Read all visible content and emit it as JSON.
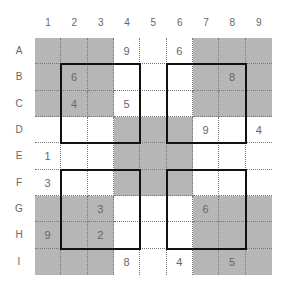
{
  "puzzle": {
    "type": "hyper-sudoku",
    "column_labels": [
      "1",
      "2",
      "3",
      "4",
      "5",
      "6",
      "7",
      "8",
      "9"
    ],
    "row_labels": [
      "A",
      "B",
      "C",
      "D",
      "E",
      "F",
      "G",
      "H",
      "I"
    ],
    "colors": {
      "shaded_box": "#b6b6b6",
      "plain_box": "#ffffff",
      "digit": "#666666",
      "window_border": "#111111"
    },
    "shaded_boxes": [
      [
        0,
        0
      ],
      [
        0,
        2
      ],
      [
        1,
        1
      ],
      [
        2,
        0
      ],
      [
        2,
        2
      ]
    ],
    "windows": [
      {
        "rows": "B-D",
        "cols": "2-4"
      },
      {
        "rows": "B-D",
        "cols": "6-8"
      },
      {
        "rows": "F-H",
        "cols": "2-4"
      },
      {
        "rows": "F-H",
        "cols": "6-8"
      }
    ],
    "grid": [
      [
        "",
        "",
        "",
        "9",
        "",
        "6",
        "",
        "",
        ""
      ],
      [
        "",
        "6",
        "",
        "",
        "",
        "",
        "",
        "8",
        ""
      ],
      [
        "",
        "4",
        "",
        "5",
        "",
        "",
        "",
        "",
        ""
      ],
      [
        "",
        "",
        "",
        "",
        "",
        "",
        "9",
        "",
        "4"
      ],
      [
        "1",
        "",
        "",
        "",
        "",
        "",
        "",
        "",
        ""
      ],
      [
        "3",
        "",
        "",
        "",
        "",
        "",
        "",
        "",
        ""
      ],
      [
        "",
        "",
        "3",
        "",
        "",
        "",
        "6",
        "",
        ""
      ],
      [
        "9",
        "",
        "2",
        "",
        "",
        "",
        "",
        "",
        ""
      ],
      [
        "",
        "",
        "",
        "8",
        "",
        "4",
        "",
        "5",
        ""
      ]
    ]
  }
}
